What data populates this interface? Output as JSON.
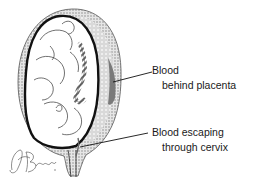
{
  "figure": {
    "colors": {
      "background": "#ffffff",
      "outline": "#111111",
      "uterus_wall": "#bdbdbd",
      "placenta": "#cfcfcf",
      "blood": "#7a7a7a",
      "fetus_fill": "#ffffff"
    }
  },
  "labels": [
    {
      "line1": "Blood",
      "line2": "behind placenta"
    },
    {
      "line1": "Blood escaping",
      "line2": "through cervix"
    }
  ],
  "signature": {
    "text": "JABrade"
  }
}
